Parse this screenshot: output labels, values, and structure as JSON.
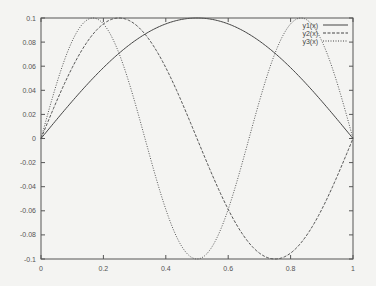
{
  "chart_data": {
    "type": "line",
    "title": "",
    "xlabel": "",
    "ylabel": "",
    "xlim": [
      0,
      1
    ],
    "ylim": [
      -0.1,
      0.1
    ],
    "grid": false,
    "legend_position": "top-right (inside)",
    "x_ticks": [
      "0",
      "0.2",
      "0.4",
      "0.6",
      "0.8",
      "1"
    ],
    "y_ticks": [
      "-0.1",
      "-0.08",
      "-0.06",
      "-0.04",
      "-0.02",
      "0",
      "0.02",
      "0.04",
      "0.06",
      "0.08",
      "0.1"
    ],
    "series": [
      {
        "name": "y1(x)",
        "style": "solid",
        "description": "0.1*sin(pi*x)",
        "x": [
          0,
          0.1,
          0.2,
          0.3,
          0.4,
          0.5,
          0.6,
          0.7,
          0.8,
          0.9,
          1.0
        ],
        "values": [
          0,
          0.0309,
          0.0588,
          0.0809,
          0.0951,
          0.1,
          0.0951,
          0.0809,
          0.0588,
          0.0309,
          0
        ]
      },
      {
        "name": "y2(x)",
        "style": "dashed",
        "description": "0.1*sin(2*pi*x)",
        "x": [
          0,
          0.1,
          0.2,
          0.25,
          0.3,
          0.4,
          0.5,
          0.6,
          0.7,
          0.75,
          0.8,
          0.9,
          1.0
        ],
        "values": [
          0,
          0.0588,
          0.0951,
          0.1,
          0.0951,
          0.0588,
          0,
          -0.0588,
          -0.0951,
          -0.1,
          -0.0951,
          -0.0588,
          0
        ]
      },
      {
        "name": "y3(x)",
        "style": "dotted",
        "description": "0.1*sin(3*pi*x)",
        "x": [
          0,
          0.1,
          0.1667,
          0.2,
          0.3,
          0.4,
          0.5,
          0.6,
          0.7,
          0.8,
          0.8333,
          0.9,
          1.0
        ],
        "values": [
          0,
          0.0809,
          0.1,
          0.0951,
          0.0309,
          -0.0588,
          -0.1,
          -0.0588,
          0.0309,
          0.0951,
          0.1,
          0.0809,
          0
        ]
      }
    ]
  },
  "legend": {
    "items": [
      {
        "label": "y1(x)"
      },
      {
        "label": "y2(x)"
      },
      {
        "label": "y3(x)"
      }
    ]
  },
  "colors": {
    "axis": "#555555",
    "line": "#444444",
    "background": "#f4f4f2"
  }
}
